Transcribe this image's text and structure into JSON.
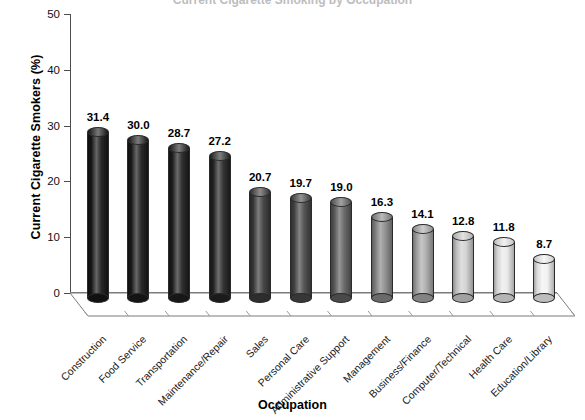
{
  "chart_data": {
    "type": "bar",
    "title": "Current Cigarette Smoking by Occupation",
    "xlabel": "Occupation",
    "ylabel": "Current Cigarette Smokers (%)",
    "ylim": [
      0,
      50
    ],
    "yticks": [
      0,
      10,
      20,
      30,
      40,
      50
    ],
    "grid": false,
    "legend": "none",
    "categories": [
      "Construction",
      "Food Service",
      "Transportation",
      "Maintenance/Repair",
      "Sales",
      "Personal Care",
      "Administrative Support",
      "Management",
      "Business/Finance",
      "Computer/Technical",
      "Health Care",
      "Education/Library"
    ],
    "values": [
      31.4,
      30.0,
      28.7,
      27.2,
      20.7,
      19.7,
      19.0,
      16.3,
      14.1,
      12.8,
      11.8,
      8.7
    ],
    "value_labels": [
      "31.4",
      "30.0",
      "28.7",
      "27.2",
      "20.7",
      "19.7",
      "19.0",
      "16.3",
      "14.1",
      "12.8",
      "11.8",
      "8.7"
    ],
    "bar_colors": [
      "#161616",
      "#191919",
      "#1d1d1d",
      "#232323",
      "#3a3a3a",
      "#464646",
      "#5e5e5e",
      "#888888",
      "#a8a8a8",
      "#cfcfcf",
      "#e8e8e8",
      "#f2f2f2"
    ],
    "axis_color": "#4d4d4d",
    "floor_color": "#ffffff",
    "floor_edge_color": "#7a7a7a"
  }
}
